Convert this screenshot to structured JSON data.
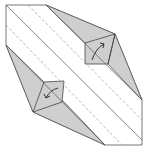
{
  "diagram": {
    "type": "origami-fold-diagram",
    "colors": {
      "paper_white": "#ffffff",
      "paper_gray": "#cfcfcf",
      "line": "#555555",
      "dash": "#9a9a9a"
    },
    "annotations": [
      {
        "name": "upper-right-fold-arrow",
        "direction": "fold toward upper-right"
      },
      {
        "name": "lower-left-fold-arrow",
        "direction": "fold toward lower-left"
      }
    ]
  }
}
